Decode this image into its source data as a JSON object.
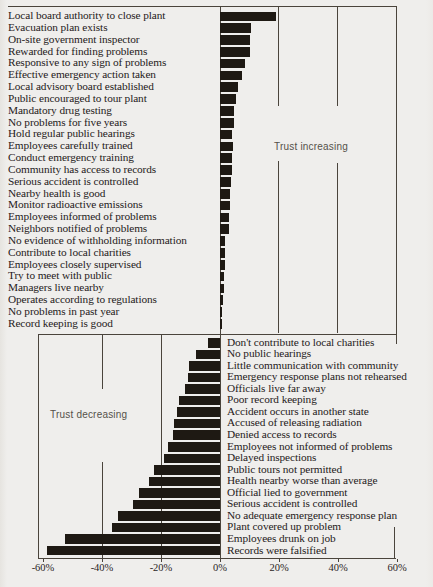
{
  "figure": {
    "kind": "scanned horizontal bar chart, trust asymmetry",
    "colors": {
      "background": "#efeeec",
      "bar": "#1e1913",
      "line": "#4a443c",
      "text": "#25201a",
      "annotation": "#55514a"
    }
  },
  "chart_data": {
    "type": "bar",
    "orientation": "horizontal",
    "x_axis": {
      "range": [
        -62,
        62
      ],
      "ticks": [
        -60,
        -40,
        -20,
        0,
        20,
        40,
        60
      ],
      "tick_labels": [
        "-60%",
        "-40%",
        "-20%",
        "0%",
        "20%",
        "40%",
        "60%"
      ]
    },
    "grid": "vertical gridlines at 20% intervals",
    "sections": [
      {
        "name": "trust_increasing",
        "annotation": "Trust increasing",
        "items": [
          {
            "label": "Local board authority to close plant",
            "value": 19
          },
          {
            "label": "Evacuation plan exists",
            "value": 10.5
          },
          {
            "label": "On-site government inspector",
            "value": 10
          },
          {
            "label": "Rewarded for finding problems",
            "value": 10
          },
          {
            "label": "Responsive to any sign of problems",
            "value": 8.5
          },
          {
            "label": "Effective emergency action taken",
            "value": 7.5
          },
          {
            "label": "Local advisory board established",
            "value": 6
          },
          {
            "label": "Public encouraged to tour plant",
            "value": 5.5
          },
          {
            "label": "Mandatory drug testing",
            "value": 4.8
          },
          {
            "label": "No problems for five years",
            "value": 4.8
          },
          {
            "label": "Hold regular public hearings",
            "value": 4.2
          },
          {
            "label": "Employees carefully trained",
            "value": 4.4
          },
          {
            "label": "Conduct emergency training",
            "value": 3.9
          },
          {
            "label": "Community has access to records",
            "value": 4.0
          },
          {
            "label": "Serious accident is controlled",
            "value": 3.6
          },
          {
            "label": "Nearby health is good",
            "value": 3.4
          },
          {
            "label": "Monitor radioactive emissions",
            "value": 3.4
          },
          {
            "label": "Employees informed of problems",
            "value": 3.2
          },
          {
            "label": "Neighbors notified of problems",
            "value": 3.0
          },
          {
            "label": "No evidence of withholding information",
            "value": 1.8
          },
          {
            "label": "Contribute to local charities",
            "value": 1.8
          },
          {
            "label": "Employees closely supervised",
            "value": 1.6
          },
          {
            "label": "Try to meet with public",
            "value": 1.5
          },
          {
            "label": "Managers live nearby",
            "value": 1.2
          },
          {
            "label": "Operates according to regulations",
            "value": 0.9
          },
          {
            "label": "No problems in past year",
            "value": 0.7
          },
          {
            "label": "Record keeping is good",
            "value": 0.7
          }
        ]
      },
      {
        "name": "trust_decreasing",
        "annotation": "Trust decreasing",
        "items": [
          {
            "label": "Don't contribute to local charities",
            "value": -4
          },
          {
            "label": "No public hearings",
            "value": -8
          },
          {
            "label": "Little communication with community",
            "value": -10.5
          },
          {
            "label": "Emergency response plans not rehearsed",
            "value": -11
          },
          {
            "label": "Officials live far away",
            "value": -12
          },
          {
            "label": "Poor record keeping",
            "value": -14
          },
          {
            "label": "Accident occurs in another state",
            "value": -14.5
          },
          {
            "label": "Accused of releasing radiation",
            "value": -15.5
          },
          {
            "label": "Denied access to records",
            "value": -16
          },
          {
            "label": "Employees not informed of problems",
            "value": -17.5
          },
          {
            "label": "Delayed inspections",
            "value": -19
          },
          {
            "label": "Public tours not permitted",
            "value": -22.5
          },
          {
            "label": "Health nearby worse than average",
            "value": -24
          },
          {
            "label": "Official lied to government",
            "value": -27.5
          },
          {
            "label": "Serious accident is controlled",
            "value": -29.5
          },
          {
            "label": "No adequate emergency response plan",
            "value": -34.5
          },
          {
            "label": "Plant covered up problem",
            "value": -36.5
          },
          {
            "label": "Employees drunk on job",
            "value": -52.5
          },
          {
            "label": "Records were falsified",
            "value": -58.5
          }
        ]
      }
    ]
  }
}
